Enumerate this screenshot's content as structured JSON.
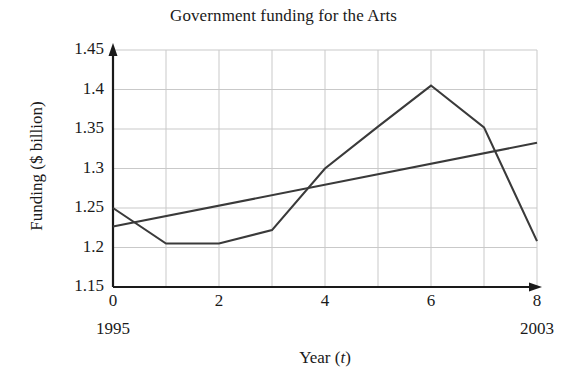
{
  "chart_data": {
    "type": "line",
    "title": "Government funding for the Arts",
    "xlabel_prefix": "Year (",
    "xlabel_var": "t",
    "xlabel_suffix": ")",
    "xlabel": "Year (t)",
    "ylabel": "Funding ($ billion)",
    "xlim": [
      0,
      8
    ],
    "ylim": [
      1.15,
      1.45
    ],
    "grid": true,
    "legend": "none",
    "x_ticks": [
      0,
      2,
      4,
      6,
      8
    ],
    "x_tick_labels": [
      "0",
      "2",
      "4",
      "6",
      "8"
    ],
    "x_gridlines": [
      0,
      1,
      2,
      3,
      4,
      5,
      6,
      7,
      8
    ],
    "y_ticks": [
      1.15,
      1.2,
      1.25,
      1.3,
      1.35,
      1.4,
      1.45
    ],
    "y_tick_labels": [
      "1.15",
      "1.2",
      "1.25",
      "1.3",
      "1.35",
      "1.4",
      "1.45"
    ],
    "annotations": [
      {
        "name": "start-year",
        "text": "1995",
        "x": 0
      },
      {
        "name": "end-year",
        "text": "2003",
        "x": 8
      }
    ],
    "x": [
      0,
      1,
      2,
      3,
      4,
      5,
      6,
      7,
      8
    ],
    "series": [
      {
        "name": "Actual funding",
        "style": "polyline",
        "color": "#3a3a3a",
        "values": [
          1.25,
          1.205,
          1.205,
          1.222,
          1.3,
          1.353,
          1.405,
          1.352,
          1.208
        ]
      },
      {
        "name": "Linear trend line",
        "style": "straight-line",
        "color": "#3a3a3a",
        "endpoints_x": [
          0,
          8
        ],
        "endpoints_y": [
          1.2265,
          1.3325
        ]
      }
    ],
    "axis_color": "#1a1a1a",
    "grid_color": "#c9c9c9",
    "background": "#ffffff"
  }
}
